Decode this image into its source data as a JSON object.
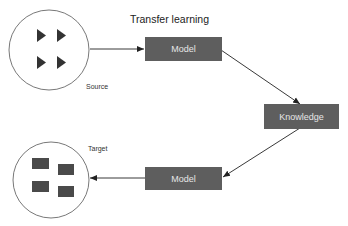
{
  "title": "Transfer learning",
  "nodes": {
    "source": {
      "label": "Source",
      "shape": "circle",
      "content_icon": "play-triangle-icon",
      "content_count": 4
    },
    "model_top": {
      "label": "Model"
    },
    "knowledge": {
      "label": "Knowledge"
    },
    "model_bottom": {
      "label": "Model"
    },
    "target": {
      "label": "Target",
      "shape": "circle",
      "content_icon": "square-block-icon",
      "content_count": 4
    }
  },
  "edges": [
    {
      "from": "source",
      "to": "model_top"
    },
    {
      "from": "model_top",
      "to": "knowledge"
    },
    {
      "from": "knowledge",
      "to": "model_bottom"
    },
    {
      "from": "model_bottom",
      "to": "target"
    }
  ],
  "colors": {
    "box_fill": "#5e5e5e",
    "box_text": "#e6e6e6",
    "shape_fill": "#3a3a3a",
    "line": "#222222"
  }
}
